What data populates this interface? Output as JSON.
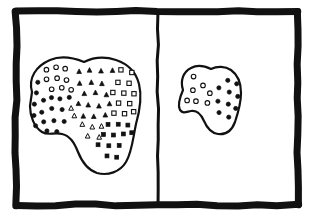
{
  "figure": {
    "style": "hand-drawn-ink-sketch",
    "ink_color": "#111111",
    "paper_color": "#ffffff",
    "width": 315,
    "height": 219,
    "frame": {
      "name": "outer-frame",
      "stroke_width": 7,
      "x": 16,
      "y": 11,
      "width": 282,
      "height": 194
    },
    "divider": {
      "name": "panel-divider",
      "orientation": "vertical",
      "x": 158,
      "stroke_width": 3
    },
    "panels": [
      {
        "id": "left-panel",
        "label": "",
        "region": {
          "id": "large-blob",
          "outline_stroke_width": 2.2,
          "fill": "#ffffff",
          "marker_count": 74
        }
      },
      {
        "id": "right-panel",
        "label": "",
        "region": {
          "id": "small-blob",
          "outline_stroke_width": 2.2,
          "fill": "#ffffff",
          "marker_count": 17
        }
      }
    ],
    "marker_types": [
      {
        "key": "open-circle",
        "shape": "circle",
        "fill": "none",
        "stroke": "#111111"
      },
      {
        "key": "filled-circle",
        "shape": "circle",
        "fill": "#111111",
        "stroke": "#111111"
      },
      {
        "key": "open-triangle",
        "shape": "triangle",
        "fill": "none",
        "stroke": "#111111"
      },
      {
        "key": "filled-triangle",
        "shape": "triangle",
        "fill": "#111111",
        "stroke": "#111111"
      },
      {
        "key": "open-square",
        "shape": "square",
        "fill": "none",
        "stroke": "#111111"
      },
      {
        "key": "filled-square",
        "shape": "square",
        "fill": "#111111",
        "stroke": "#111111"
      }
    ]
  },
  "chart_data": {
    "type": "scatter",
    "title": "",
    "xlabel": "",
    "ylabel": "",
    "grid": false,
    "legend": "none",
    "xlim": [
      0,
      315
    ],
    "ylim": [
      0,
      219
    ],
    "panels": [
      {
        "name": "large-blob",
        "outline_path": "M 32 92 C 28 78, 36 66, 50 60 C 62 55, 74 58, 84 62 C 92 58, 104 56, 116 60 C 128 64, 136 72, 139 84 C 142 96, 140 110, 136 124 C 133 138, 132 152, 126 162 C 120 172, 108 176, 97 173 C 88 170, 82 162, 78 152 C 74 142, 70 136, 62 134 C 54 132, 48 136, 42 132 C 34 127, 30 116, 30 106 Z",
        "points": [
          {
            "x": 46,
            "y": 70,
            "type": "open-circle"
          },
          {
            "x": 56,
            "y": 67,
            "type": "open-circle"
          },
          {
            "x": 65,
            "y": 69,
            "type": "open-circle"
          },
          {
            "x": 47,
            "y": 79,
            "type": "open-circle"
          },
          {
            "x": 57,
            "y": 78,
            "type": "open-circle"
          },
          {
            "x": 66,
            "y": 80,
            "type": "open-circle"
          },
          {
            "x": 52,
            "y": 89,
            "type": "open-circle"
          },
          {
            "x": 62,
            "y": 88,
            "type": "open-circle"
          },
          {
            "x": 71,
            "y": 90,
            "type": "open-circle"
          },
          {
            "x": 38,
            "y": 82,
            "type": "filled-circle"
          },
          {
            "x": 36,
            "y": 93,
            "type": "filled-circle"
          },
          {
            "x": 44,
            "y": 100,
            "type": "filled-circle"
          },
          {
            "x": 34,
            "y": 104,
            "type": "filled-circle"
          },
          {
            "x": 42,
            "y": 112,
            "type": "filled-circle"
          },
          {
            "x": 34,
            "y": 115,
            "type": "filled-circle"
          },
          {
            "x": 51,
            "y": 98,
            "type": "filled-circle"
          },
          {
            "x": 60,
            "y": 99,
            "type": "filled-circle"
          },
          {
            "x": 69,
            "y": 97,
            "type": "filled-circle"
          },
          {
            "x": 52,
            "y": 108,
            "type": "filled-circle"
          },
          {
            "x": 62,
            "y": 110,
            "type": "filled-circle"
          },
          {
            "x": 44,
            "y": 122,
            "type": "filled-circle"
          },
          {
            "x": 54,
            "y": 121,
            "type": "filled-circle"
          },
          {
            "x": 64,
            "y": 121,
            "type": "filled-circle"
          },
          {
            "x": 36,
            "y": 126,
            "type": "filled-circle"
          },
          {
            "x": 47,
            "y": 131,
            "type": "filled-circle"
          },
          {
            "x": 57,
            "y": 132,
            "type": "filled-circle"
          },
          {
            "x": 79,
            "y": 72,
            "type": "filled-triangle"
          },
          {
            "x": 90,
            "y": 70,
            "type": "filled-triangle"
          },
          {
            "x": 101,
            "y": 71,
            "type": "filled-triangle"
          },
          {
            "x": 112,
            "y": 70,
            "type": "filled-triangle"
          },
          {
            "x": 80,
            "y": 83,
            "type": "filled-triangle"
          },
          {
            "x": 91,
            "y": 82,
            "type": "filled-triangle"
          },
          {
            "x": 102,
            "y": 84,
            "type": "filled-triangle"
          },
          {
            "x": 84,
            "y": 94,
            "type": "filled-triangle"
          },
          {
            "x": 95,
            "y": 93,
            "type": "filled-triangle"
          },
          {
            "x": 106,
            "y": 95,
            "type": "filled-triangle"
          },
          {
            "x": 78,
            "y": 104,
            "type": "filled-triangle"
          },
          {
            "x": 88,
            "y": 105,
            "type": "filled-triangle"
          },
          {
            "x": 99,
            "y": 106,
            "type": "filled-triangle"
          },
          {
            "x": 109,
            "y": 104,
            "type": "filled-triangle"
          },
          {
            "x": 83,
            "y": 116,
            "type": "filled-triangle"
          },
          {
            "x": 94,
            "y": 117,
            "type": "filled-triangle"
          },
          {
            "x": 105,
            "y": 115,
            "type": "filled-triangle"
          },
          {
            "x": 74,
            "y": 116,
            "type": "open-triangle"
          },
          {
            "x": 82,
            "y": 124,
            "type": "open-triangle"
          },
          {
            "x": 71,
            "y": 108,
            "type": "open-triangle"
          },
          {
            "x": 92,
            "y": 127,
            "type": "open-triangle"
          },
          {
            "x": 101,
            "y": 126,
            "type": "open-triangle"
          },
          {
            "x": 88,
            "y": 136,
            "type": "open-triangle"
          },
          {
            "x": 99,
            "y": 137,
            "type": "open-triangle"
          },
          {
            "x": 121,
            "y": 70,
            "type": "open-square"
          },
          {
            "x": 132,
            "y": 72,
            "type": "open-square"
          },
          {
            "x": 118,
            "y": 82,
            "type": "open-square"
          },
          {
            "x": 129,
            "y": 83,
            "type": "open-square"
          },
          {
            "x": 113,
            "y": 92,
            "type": "open-square"
          },
          {
            "x": 124,
            "y": 93,
            "type": "open-square"
          },
          {
            "x": 134,
            "y": 94,
            "type": "open-square"
          },
          {
            "x": 119,
            "y": 103,
            "type": "open-square"
          },
          {
            "x": 130,
            "y": 104,
            "type": "open-square"
          },
          {
            "x": 114,
            "y": 113,
            "type": "open-square"
          },
          {
            "x": 125,
            "y": 114,
            "type": "open-square"
          },
          {
            "x": 134,
            "y": 112,
            "type": "open-square"
          },
          {
            "x": 108,
            "y": 124,
            "type": "filled-square"
          },
          {
            "x": 118,
            "y": 124,
            "type": "filled-square"
          },
          {
            "x": 128,
            "y": 125,
            "type": "filled-square"
          },
          {
            "x": 103,
            "y": 134,
            "type": "filled-square"
          },
          {
            "x": 113,
            "y": 135,
            "type": "filled-square"
          },
          {
            "x": 123,
            "y": 134,
            "type": "filled-square"
          },
          {
            "x": 132,
            "y": 133,
            "type": "filled-square"
          },
          {
            "x": 98,
            "y": 145,
            "type": "filled-square"
          },
          {
            "x": 109,
            "y": 146,
            "type": "filled-square"
          },
          {
            "x": 119,
            "y": 145,
            "type": "filled-square"
          },
          {
            "x": 107,
            "y": 156,
            "type": "filled-square"
          },
          {
            "x": 117,
            "y": 157,
            "type": "filled-square"
          }
        ]
      },
      {
        "name": "small-blob",
        "outline_path": "M 183 90 C 180 81, 183 72, 191 68 C 198 64, 205 66, 211 69 C 217 66, 225 66, 231 70 C 238 75, 241 83, 241 93 C 241 103, 238 113, 235 122 C 232 130, 226 135, 218 134 C 211 133, 207 128, 204 121 C 201 114, 197 110, 191 111 C 186 112, 183 114, 180 110 C 177 105, 180 97, 183 90 Z",
        "points": [
          {
            "x": 194,
            "y": 77,
            "type": "open-circle"
          },
          {
            "x": 203,
            "y": 85,
            "type": "open-circle"
          },
          {
            "x": 193,
            "y": 90,
            "type": "open-circle"
          },
          {
            "x": 210,
            "y": 93,
            "type": "open-circle"
          },
          {
            "x": 187,
            "y": 100,
            "type": "open-circle"
          },
          {
            "x": 196,
            "y": 101,
            "type": "open-circle"
          },
          {
            "x": 207,
            "y": 103,
            "type": "open-circle"
          },
          {
            "x": 228,
            "y": 80,
            "type": "filled-circle"
          },
          {
            "x": 237,
            "y": 84,
            "type": "filled-circle"
          },
          {
            "x": 219,
            "y": 88,
            "type": "filled-circle"
          },
          {
            "x": 229,
            "y": 92,
            "type": "filled-circle"
          },
          {
            "x": 238,
            "y": 96,
            "type": "filled-circle"
          },
          {
            "x": 218,
            "y": 101,
            "type": "filled-circle"
          },
          {
            "x": 228,
            "y": 104,
            "type": "filled-circle"
          },
          {
            "x": 236,
            "y": 108,
            "type": "filled-circle"
          },
          {
            "x": 219,
            "y": 113,
            "type": "filled-circle"
          },
          {
            "x": 229,
            "y": 117,
            "type": "filled-circle"
          }
        ]
      }
    ]
  }
}
